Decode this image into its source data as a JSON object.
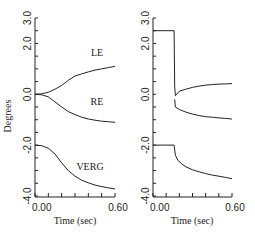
{
  "chart_data": [
    {
      "type": "line",
      "panel": "left",
      "ylabel": "Degrees",
      "xlabel": "Time (sec)",
      "xlim": [
        0.0,
        0.6
      ],
      "ylim": [
        -4.0,
        3.0
      ],
      "xtick_labels": [
        "0.00",
        "0.60"
      ],
      "ytick_labels": [
        "3.0",
        "2.0",
        "0.0",
        "-2.0",
        "-4.0"
      ],
      "yticks": [
        3.0,
        2.0,
        0.0,
        -2.0,
        -4.0
      ],
      "series": [
        {
          "name": "LE",
          "x": [
            0.0,
            0.05,
            0.1,
            0.15,
            0.2,
            0.25,
            0.3,
            0.35,
            0.4,
            0.45,
            0.5,
            0.55,
            0.6
          ],
          "y": [
            0.0,
            0.02,
            0.08,
            0.2,
            0.35,
            0.55,
            0.72,
            0.8,
            0.88,
            0.95,
            1.0,
            1.05,
            1.1
          ]
        },
        {
          "name": "RE",
          "x": [
            0.0,
            0.05,
            0.1,
            0.15,
            0.2,
            0.25,
            0.3,
            0.35,
            0.4,
            0.45,
            0.5,
            0.55,
            0.6
          ],
          "y": [
            0.0,
            -0.02,
            -0.1,
            -0.3,
            -0.5,
            -0.68,
            -0.8,
            -0.9,
            -0.97,
            -1.02,
            -1.06,
            -1.08,
            -1.1
          ]
        },
        {
          "name": "VERG",
          "x": [
            0.0,
            0.05,
            0.1,
            0.15,
            0.2,
            0.25,
            0.3,
            0.35,
            0.4,
            0.45,
            0.5,
            0.55,
            0.6
          ],
          "y": [
            -2.0,
            -2.02,
            -2.12,
            -2.35,
            -2.7,
            -3.0,
            -3.22,
            -3.38,
            -3.48,
            -3.57,
            -3.63,
            -3.68,
            -3.72
          ]
        }
      ],
      "annotations": [
        "LE",
        "RE",
        "VERG"
      ]
    },
    {
      "type": "line",
      "panel": "right",
      "ylabel": "",
      "xlabel": "Time (sec)",
      "xlim": [
        0.0,
        0.6
      ],
      "ylim": [
        -4.0,
        3.0
      ],
      "xtick_labels": [
        "0.00",
        "0.60"
      ],
      "ytick_labels": [
        "3.0",
        "2.0",
        "0.0",
        "-2.0",
        "-4.0"
      ],
      "yticks": [
        3.0,
        2.0,
        0.0,
        -2.0,
        -4.0
      ],
      "series": [
        {
          "name": "upper",
          "x": [
            0.0,
            0.16,
            0.165,
            0.17,
            0.2,
            0.25,
            0.3,
            0.35,
            0.4,
            0.45,
            0.5,
            0.55,
            0.6
          ],
          "y": [
            2.5,
            2.5,
            0.3,
            -0.05,
            0.12,
            0.2,
            0.27,
            0.32,
            0.36,
            0.38,
            0.4,
            0.41,
            0.42
          ]
        },
        {
          "name": "lower",
          "x": [
            0.165,
            0.17,
            0.2,
            0.25,
            0.3,
            0.35,
            0.4,
            0.45,
            0.5,
            0.55,
            0.6
          ],
          "y": [
            -0.2,
            -0.5,
            -0.6,
            -0.7,
            -0.78,
            -0.84,
            -0.88,
            -0.9,
            -0.93,
            -0.95,
            -0.97
          ]
        },
        {
          "name": "VERG",
          "x": [
            0.0,
            0.16,
            0.17,
            0.19,
            0.22,
            0.25,
            0.3,
            0.35,
            0.4,
            0.45,
            0.5,
            0.55,
            0.6
          ],
          "y": [
            -2.0,
            -2.0,
            -2.4,
            -2.6,
            -2.75,
            -2.85,
            -2.97,
            -3.05,
            -3.12,
            -3.18,
            -3.22,
            -3.27,
            -3.32
          ]
        }
      ],
      "annotations": []
    }
  ]
}
